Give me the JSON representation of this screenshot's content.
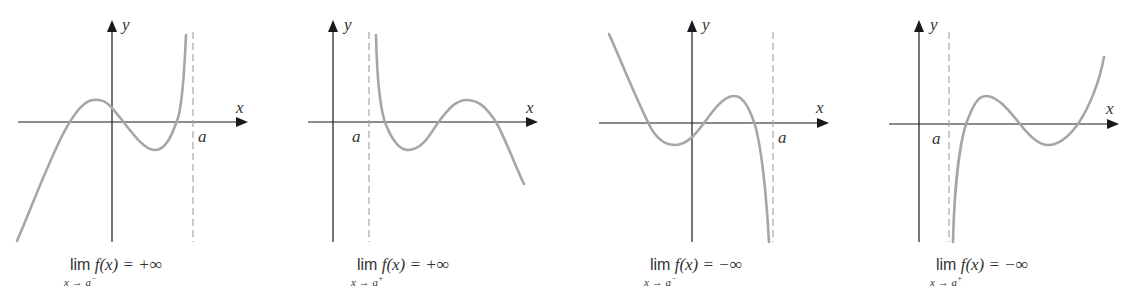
{
  "figure": {
    "colors": {
      "axes": "#1a1a1a",
      "curve": "#a6a6a6",
      "asymptote": "#a6a6a6",
      "text": "#333333"
    },
    "panels": [
      {
        "x_label": "x",
        "y_label": "y",
        "a_label": "a",
        "caption": {
          "lim": "lim",
          "func": "f(x) = +∞",
          "subscript": "x → a",
          "side": "−"
        },
        "behavior": "f(x) → +∞ as x → a from the left"
      },
      {
        "x_label": "x",
        "y_label": "y",
        "a_label": "a",
        "caption": {
          "lim": "lim",
          "func": "f(x) = +∞",
          "subscript": "x → a",
          "side": "+"
        },
        "behavior": "f(x) → +∞ as x → a from the right"
      },
      {
        "x_label": "x",
        "y_label": "y",
        "a_label": "a",
        "caption": {
          "lim": "lim",
          "func": "f(x) = −∞",
          "subscript": "x → a",
          "side": "−"
        },
        "behavior": "f(x) → −∞ as x → a from the left"
      },
      {
        "x_label": "x",
        "y_label": "y",
        "a_label": "a",
        "caption": {
          "lim": "lim",
          "func": "f(x) = −∞",
          "subscript": "x → a",
          "side": "+"
        },
        "behavior": "f(x) → −∞ as x → a from the right"
      }
    ]
  }
}
